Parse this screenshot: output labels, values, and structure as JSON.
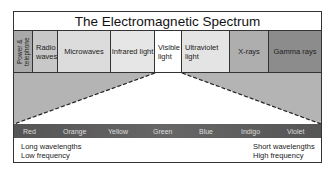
{
  "title": "The Electromagnetic Spectrum",
  "bands": [
    {
      "label": "Power & telephone",
      "color": "#a9a9a9"
    },
    {
      "label": "Radio waves",
      "color": "#c8c8c8"
    },
    {
      "label": "Microwaves",
      "color": "#dcdcdc"
    },
    {
      "label": "Infrared light",
      "color": "#e6e6e6"
    },
    {
      "label": "Visible light",
      "color": "#ffffff"
    },
    {
      "label": "Ultraviolet light",
      "color": "#e4e4e4"
    },
    {
      "label": "X-rays",
      "color": "#aeaeae"
    },
    {
      "label": "Gamma rays",
      "color": "#8c8c8c"
    }
  ],
  "visible_colors": [
    "Red",
    "Orange",
    "Yellow",
    "Green",
    "Blue",
    "Indigo",
    "Violet"
  ],
  "left_desc": {
    "line1": "Long wavelengths",
    "line2": "Low frequency"
  },
  "right_desc": {
    "line1": "Short wavelengths",
    "line2": "High frequency"
  },
  "wedge_color": "#b4b4b4"
}
